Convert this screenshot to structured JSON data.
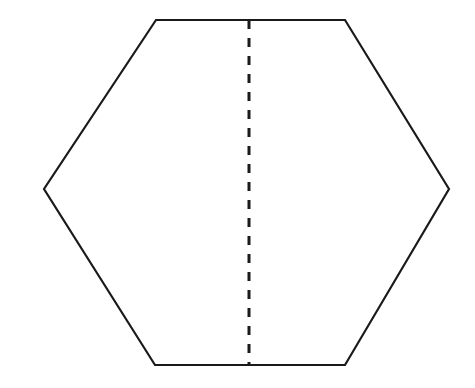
{
  "figure": {
    "name": "hexagon-with-vertical-line-of-symmetry",
    "background_color": "#FFFFFF",
    "canvas": {
      "width": 475,
      "height": 388
    }
  },
  "shapes": {
    "hexagon": {
      "label": "hexagon",
      "stroke_color": "#1A1A1A",
      "stroke_width": 2.2,
      "fill_color": "none",
      "points": "156,20 345,20 449,189 345,365 155,365 44,189",
      "vertices": [
        {
          "name": "top-left",
          "x": 156,
          "y": 20
        },
        {
          "name": "top-right",
          "x": 345,
          "y": 20
        },
        {
          "name": "right",
          "x": 449,
          "y": 189
        },
        {
          "name": "bottom-right",
          "x": 345,
          "y": 365
        },
        {
          "name": "bottom-left",
          "x": 155,
          "y": 365
        },
        {
          "name": "left",
          "x": 44,
          "y": 189
        }
      ]
    },
    "symmetry_line": {
      "label": "line of symmetry",
      "stroke_color": "#1A1A1A",
      "stroke_width": 3.0,
      "dash_pattern": "9 9",
      "x1": 249,
      "y1": 20,
      "x2": 249,
      "y2": 365
    }
  }
}
